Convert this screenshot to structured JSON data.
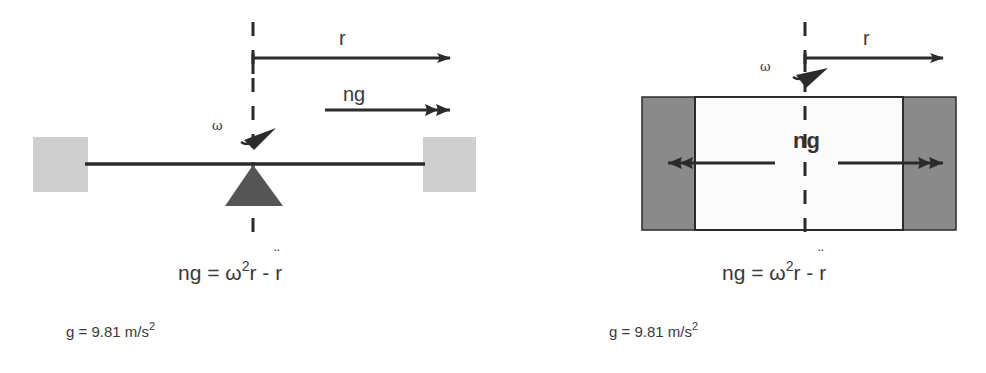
{
  "diagrams": [
    {
      "name": "rotating-beam",
      "labels": {
        "radius": "r",
        "force": "ng",
        "angular_velocity": "ω"
      },
      "equation": {
        "lhs": "ng = ",
        "omega": "ω",
        "exp": "2",
        "r": "r - ",
        "rddot": "r"
      },
      "gravity": {
        "text": "g = 9.81 m/s",
        "exp": "2"
      }
    },
    {
      "name": "rotating-drum",
      "labels": {
        "radius": "r",
        "force": "ng",
        "angular_velocity": "ω"
      },
      "equation": {
        "lhs": "ng = ",
        "omega": "ω",
        "exp": "2",
        "r": "r - ",
        "rddot": "r"
      },
      "gravity": {
        "text": "g = 9.81 m/s",
        "exp": "2"
      }
    }
  ],
  "colors": {
    "line": "#2b2b2b",
    "block_light": "#cfcfcf",
    "block_dark": "#8a8a8a",
    "pivot": "#555555"
  }
}
